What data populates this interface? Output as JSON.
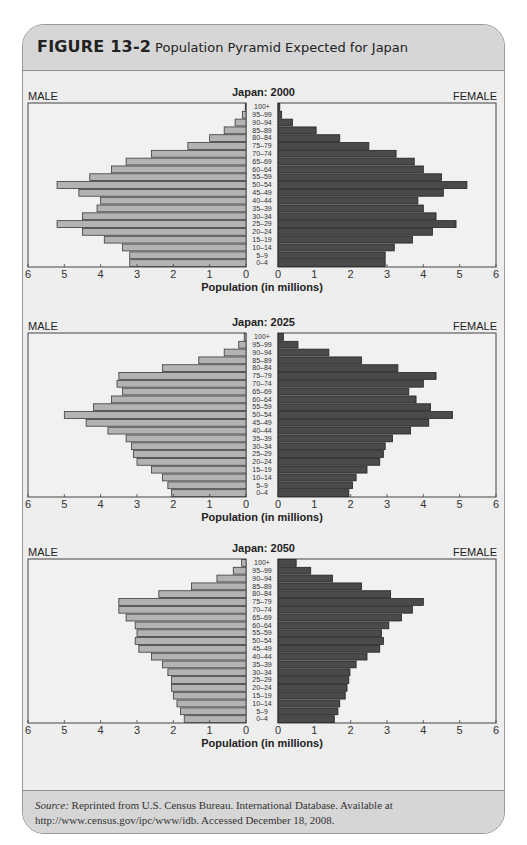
{
  "figure": {
    "label": "FIGURE 13-2",
    "title": "Population Pyramid Expected for Japan"
  },
  "source": {
    "prefix": "Source:",
    "text": " Reprinted from U.S. Census Bureau. International Database. Available at http://www.census.gov/ipc/www/idb. Accessed December 18, 2008."
  },
  "colors": {
    "male_bar": "#b3b3b3",
    "female_bar": "#4a4a4a",
    "frame": "#444444",
    "card_header": "#d6d6d6",
    "card_body": "#eeeeee"
  },
  "chart_data": [
    {
      "type": "bar",
      "orientation": "horizontal-pyramid",
      "title": "Japan: 2000",
      "left_label": "MALE",
      "right_label": "FEMALE",
      "xlabel": "Population (in millions)",
      "xlim": [
        0,
        6
      ],
      "xticks_left": [
        "6",
        "5",
        "4",
        "3",
        "2",
        "1",
        "0"
      ],
      "xticks_right": [
        "0",
        "1",
        "2",
        "3",
        "4",
        "5",
        "6"
      ],
      "categories": [
        "100+",
        "95–99",
        "90–94",
        "85–89",
        "80–84",
        "75–79",
        "70–74",
        "65–69",
        "60–64",
        "55–59",
        "50–54",
        "45–49",
        "40–44",
        "35–39",
        "30–34",
        "25–29",
        "20–24",
        "15–19",
        "10–14",
        "5–9",
        "0–4"
      ],
      "series": [
        {
          "name": "Male",
          "values": [
            0.02,
            0.1,
            0.3,
            0.6,
            1.0,
            1.6,
            2.6,
            3.3,
            3.7,
            4.3,
            5.2,
            4.6,
            4.0,
            4.1,
            4.5,
            5.2,
            4.5,
            3.9,
            3.4,
            3.2,
            3.2
          ]
        },
        {
          "name": "Female",
          "values": [
            0.05,
            0.1,
            0.4,
            1.05,
            1.7,
            2.5,
            3.25,
            3.75,
            4.0,
            4.5,
            5.2,
            4.55,
            3.85,
            4.0,
            4.35,
            4.9,
            4.25,
            3.7,
            3.2,
            2.95,
            2.95
          ]
        }
      ]
    },
    {
      "type": "bar",
      "orientation": "horizontal-pyramid",
      "title": "Japan: 2025",
      "left_label": "MALE",
      "right_label": "FEMALE",
      "xlabel": "Population (in millions)",
      "xlim": [
        0,
        6
      ],
      "xticks_left": [
        "6",
        "5",
        "4",
        "3",
        "2",
        "1",
        "0"
      ],
      "xticks_right": [
        "0",
        "1",
        "2",
        "3",
        "4",
        "5",
        "6"
      ],
      "categories": [
        "100+",
        "95–99",
        "90–94",
        "85–89",
        "80–84",
        "75–79",
        "70–74",
        "65–69",
        "60–64",
        "55–59",
        "50–54",
        "45–49",
        "40–44",
        "35–39",
        "30–34",
        "25–29",
        "20–24",
        "15–19",
        "10–14",
        "5–9",
        "0–4"
      ],
      "series": [
        {
          "name": "Male",
          "values": [
            0.05,
            0.2,
            0.6,
            1.3,
            2.3,
            3.5,
            3.55,
            3.4,
            3.7,
            4.2,
            5.0,
            4.4,
            3.8,
            3.3,
            3.15,
            3.1,
            3.0,
            2.6,
            2.3,
            2.15,
            2.05
          ]
        },
        {
          "name": "Female",
          "values": [
            0.15,
            0.55,
            1.4,
            2.3,
            3.3,
            4.35,
            4.0,
            3.6,
            3.8,
            4.2,
            4.8,
            4.15,
            3.65,
            3.15,
            2.95,
            2.9,
            2.8,
            2.45,
            2.15,
            2.05,
            1.95
          ]
        }
      ]
    },
    {
      "type": "bar",
      "orientation": "horizontal-pyramid",
      "title": "Japan: 2050",
      "left_label": "MALE",
      "right_label": "FEMALE",
      "xlabel": "Population (in millions)",
      "xlim": [
        0,
        6
      ],
      "xticks_left": [
        "6",
        "5",
        "4",
        "3",
        "2",
        "1",
        "0"
      ],
      "xticks_right": [
        "0",
        "1",
        "2",
        "3",
        "4",
        "5",
        "6"
      ],
      "categories": [
        "100+",
        "95–99",
        "90–94",
        "85–89",
        "80–84",
        "75–79",
        "70–74",
        "65–69",
        "60–64",
        "55–59",
        "50–54",
        "45–49",
        "40–44",
        "35–39",
        "30–34",
        "25–29",
        "20–24",
        "15–19",
        "10–14",
        "5–9",
        "0–4"
      ],
      "series": [
        {
          "name": "Male",
          "values": [
            0.12,
            0.35,
            0.8,
            1.5,
            2.4,
            3.5,
            3.5,
            3.3,
            3.05,
            3.0,
            3.05,
            2.95,
            2.6,
            2.3,
            2.15,
            2.05,
            2.05,
            2.0,
            1.9,
            1.8,
            1.7
          ]
        },
        {
          "name": "Female",
          "values": [
            0.5,
            0.9,
            1.5,
            2.3,
            3.1,
            4.0,
            3.7,
            3.4,
            3.05,
            2.85,
            2.9,
            2.8,
            2.45,
            2.15,
            1.98,
            1.95,
            1.9,
            1.85,
            1.7,
            1.65,
            1.55
          ]
        }
      ]
    }
  ]
}
